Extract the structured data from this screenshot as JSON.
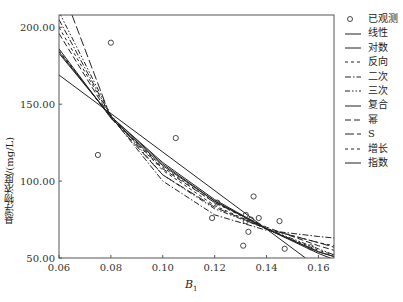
{
  "chart_data": {
    "type": "scatter",
    "title": "",
    "xlabel": "B1",
    "xlabel_main": "B",
    "xlabel_sub": "1",
    "ylabel": "悬浮物浓度/(mg/L)",
    "xlim": [
      0.06,
      0.166
    ],
    "ylim": [
      50,
      208
    ],
    "x_ticks": [
      "0.06",
      "0.08",
      "0.10",
      "0.12",
      "0.14",
      "0.16"
    ],
    "y_ticks": [
      "50.00",
      "100.00",
      "150.00",
      "200.00"
    ],
    "grid": false,
    "legend_position": "right",
    "observed": {
      "name": "已观测",
      "x": [
        0.08,
        0.075,
        0.105,
        0.119,
        0.121,
        0.132,
        0.135,
        0.132,
        0.133,
        0.131,
        0.134,
        0.145,
        0.137,
        0.147,
        0.157
      ],
      "y": [
        190,
        117,
        128,
        76,
        86,
        74,
        90,
        78,
        67,
        58,
        75,
        74,
        76,
        56,
        57
      ]
    },
    "series": [
      {
        "name": "线性",
        "style": "solid",
        "x": [
          0.06,
          0.155
        ],
        "y": [
          169,
          50
        ]
      },
      {
        "name": "对数",
        "style": "solid",
        "x": [
          0.06,
          0.08,
          0.1,
          0.12,
          0.14,
          0.16,
          0.166
        ],
        "y": [
          184,
          142,
          112,
          88,
          69,
          53,
          49
        ]
      },
      {
        "name": "反向",
        "style": "dash-short",
        "x": [
          0.06,
          0.08,
          0.1,
          0.12,
          0.14,
          0.16,
          0.166
        ],
        "y": [
          200,
          142,
          107,
          84,
          69,
          60,
          58
        ]
      },
      {
        "name": "二次",
        "style": "dash-dot",
        "x": [
          0.06,
          0.08,
          0.1,
          0.12,
          0.14,
          0.16,
          0.166
        ],
        "y": [
          205,
          142,
          100,
          78,
          68,
          64,
          63
        ]
      },
      {
        "name": "三次",
        "style": "dash-dot-dot",
        "x": [
          0.06,
          0.08,
          0.1,
          0.12,
          0.14,
          0.16,
          0.166
        ],
        "y": [
          210,
          143,
          104,
          82,
          69,
          56,
          52
        ]
      },
      {
        "name": "复合",
        "style": "solid",
        "x": [
          0.06,
          0.08,
          0.1,
          0.12,
          0.14,
          0.16,
          0.166
        ],
        "y": [
          186,
          141,
          110,
          87,
          69,
          54,
          51
        ]
      },
      {
        "name": "幂",
        "style": "dashed",
        "x": [
          0.06,
          0.08,
          0.1,
          0.12,
          0.14,
          0.16,
          0.166
        ],
        "y": [
          196,
          141,
          108,
          86,
          70,
          58,
          55
        ]
      },
      {
        "name": "S",
        "style": "long-dash",
        "x": [
          0.065,
          0.08,
          0.1,
          0.12,
          0.14,
          0.16,
          0.166
        ],
        "y": [
          208,
          141,
          104,
          83,
          69,
          60,
          57
        ]
      },
      {
        "name": "增长",
        "style": "dash-short",
        "x": [
          0.06,
          0.08,
          0.1,
          0.12,
          0.14,
          0.16,
          0.166
        ],
        "y": [
          185,
          141,
          109,
          86,
          69,
          55,
          52
        ]
      },
      {
        "name": "指数",
        "style": "solid",
        "x": [
          0.06,
          0.08,
          0.1,
          0.12,
          0.14,
          0.16,
          0.166
        ],
        "y": [
          183,
          142,
          111,
          87,
          69,
          54,
          51
        ]
      }
    ]
  },
  "legend": {
    "items": [
      "已观测",
      "线性",
      "对数",
      "反向",
      "二次",
      "三次",
      "复合",
      "幂",
      "S",
      "增长",
      "指数"
    ]
  }
}
